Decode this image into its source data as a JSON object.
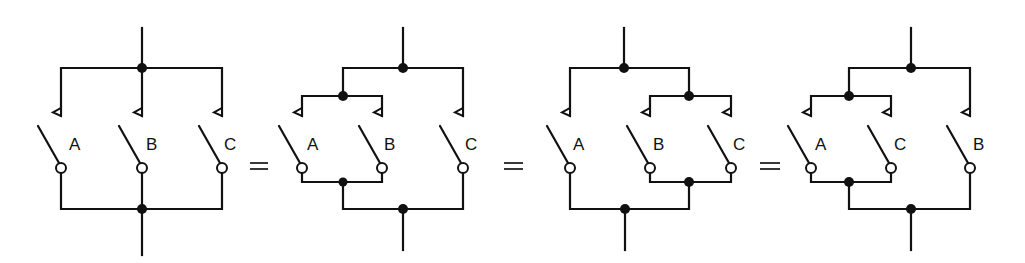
{
  "diagram": {
    "type": "switching-circuit-equivalence",
    "equals_symbol": "=",
    "circuits": [
      {
        "id": "circuit-1",
        "grouping": "A + B + C",
        "switches": [
          {
            "label": "A",
            "x": 61
          },
          {
            "label": "B",
            "x": 142
          },
          {
            "label": "C",
            "x": 222
          }
        ]
      },
      {
        "id": "circuit-2",
        "grouping": "(A + B) + C",
        "switches": [
          {
            "label": "A",
            "x": 302
          },
          {
            "label": "B",
            "x": 382
          },
          {
            "label": "C",
            "x": 463
          }
        ]
      },
      {
        "id": "circuit-3",
        "grouping": "A + (B + C)",
        "switches": [
          {
            "label": "A",
            "x": 570
          },
          {
            "label": "B",
            "x": 650
          },
          {
            "label": "C",
            "x": 731
          }
        ]
      },
      {
        "id": "circuit-4",
        "grouping": "(A + C) + B",
        "switches": [
          {
            "label": "A",
            "x": 811
          },
          {
            "label": "C",
            "x": 891
          },
          {
            "label": "B",
            "x": 970
          }
        ]
      }
    ]
  }
}
